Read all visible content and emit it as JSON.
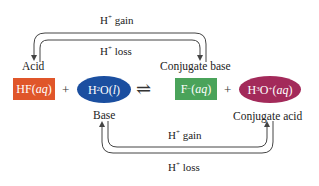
{
  "diagram": {
    "colors": {
      "acid": "#e0562a",
      "base": "#1b4fa0",
      "conjugate_base": "#4aa35a",
      "conjugate_acid": "#a32a5a",
      "arrow": "#444444"
    },
    "species": {
      "acid": {
        "formula_main": "HF(",
        "formula_state": "aq",
        "formula_close": ")",
        "role": "Acid"
      },
      "base": {
        "formula_h": "H",
        "formula_sub": "2",
        "formula_rest": "O(",
        "formula_state": "l",
        "formula_close": ")",
        "role": "Base"
      },
      "conjugate_base": {
        "formula_main": "F",
        "formula_sup": "−",
        "formula_open": "(",
        "formula_state": "aq",
        "formula_close": ")",
        "role": "Conjugate base"
      },
      "conjugate_acid": {
        "formula_h": "H",
        "formula_sub": "3",
        "formula_o": "O",
        "formula_sup": "+",
        "formula_open": "(",
        "formula_state": "aq",
        "formula_close": ")",
        "role": "Conjugate acid"
      }
    },
    "operators": {
      "plus": "+",
      "equilibrium": "⇌"
    },
    "top_arrows": {
      "gain": {
        "h": "H",
        "sup": "+",
        "text": " gain"
      },
      "loss": {
        "h": "H",
        "sup": "+",
        "text": " loss"
      }
    },
    "bottom_arrows": {
      "gain": {
        "h": "H",
        "sup": "+",
        "text": " gain"
      },
      "loss": {
        "h": "H",
        "sup": "+",
        "text": " loss"
      }
    }
  }
}
